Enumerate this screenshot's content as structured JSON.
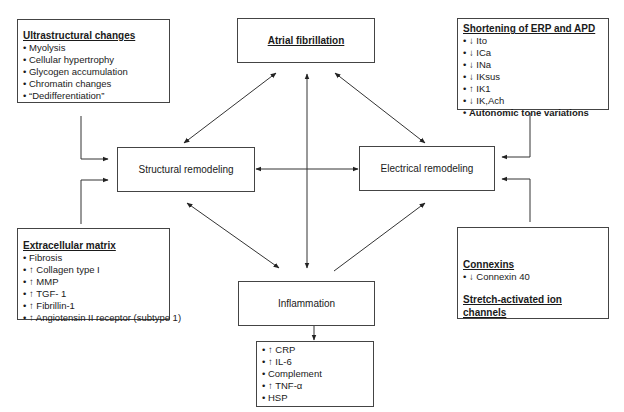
{
  "diagram": {
    "atrial_fibrillation": "Atrial fibrillation",
    "structural_remodeling": "Structural remodeling",
    "electrical_remodeling": "Electrical remodeling",
    "inflammation": "Inflammation",
    "ultrastructural": {
      "heading": "Ultrastructural changes",
      "items": [
        "Myolysis",
        "Cellular hypertrophy",
        "Glycogen accumulation",
        "Chromatin changes",
        "“Dedifferentiation”"
      ]
    },
    "erp_apd": {
      "heading": "Shortening of ERP and APD",
      "items": [
        "↓ Ito",
        "↓ ICa",
        "↓ INa",
        "↓ IKsus",
        "↑ IK1",
        "↓ IK,Ach"
      ],
      "bold_item": "Autonomic tone variations"
    },
    "extracellular": {
      "heading": "Extracellular matrix",
      "items": [
        "Fibrosis",
        "↑ Collagen type I",
        "↑ MMP",
        "↑ TGF- 1",
        "↑ Fibrillin-1",
        "↑ Angiotensin II receptor (subtype 1)"
      ]
    },
    "connexins": {
      "heading": "Connexins",
      "items": [
        "↓ Connexin 40"
      ],
      "heading2": "Stretch-activated ion channels"
    },
    "inflammation_markers": {
      "items": [
        "↑ CRP",
        "↑ IL-6",
        "Complement",
        "↑ TNF-α",
        "HSP"
      ]
    }
  }
}
